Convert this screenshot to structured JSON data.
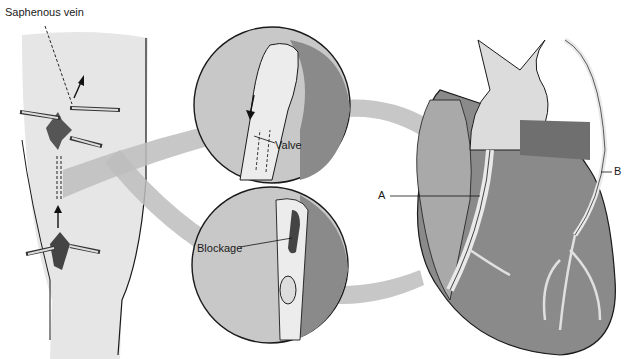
{
  "figure": {
    "labels": {
      "saphenous_vein": "Saphenous vein",
      "valve": "Valve",
      "blockage": "Blockage",
      "graft_a": "A",
      "graft_b": "B"
    },
    "colors": {
      "background": "#ffffff",
      "skin": "#e6e6e6",
      "tissue_light": "#c8c8c8",
      "tissue_mid": "#a9a9a9",
      "tissue_dark": "#7a7a7a",
      "arrow": "#bdbdbd",
      "vessel": "#e9e9e9",
      "outline": "#1a1a1a"
    }
  }
}
